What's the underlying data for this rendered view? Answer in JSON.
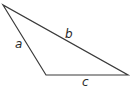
{
  "diagram": {
    "type": "triangle",
    "stroke_color": "#3a3a3a",
    "vertices": {
      "top": [
        3,
        5
      ],
      "bottom_left": [
        46,
        75
      ],
      "right": [
        128,
        75
      ]
    },
    "sides": [
      {
        "name": "a",
        "label": "a",
        "from": "top",
        "to": "bottom_left"
      },
      {
        "name": "b",
        "label": "b",
        "from": "top",
        "to": "right"
      },
      {
        "name": "c",
        "label": "c",
        "from": "bottom_left",
        "to": "right"
      }
    ]
  }
}
